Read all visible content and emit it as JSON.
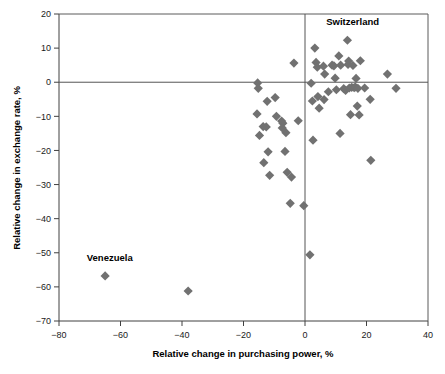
{
  "chart_data": {
    "type": "scatter",
    "title": "",
    "xlabel": "Relative change in purchasing power, %",
    "ylabel": "Relative change in exchange rate, %",
    "xlim": [
      -80,
      40
    ],
    "ylim": [
      -70,
      20
    ],
    "xticks": [
      -80,
      -60,
      -40,
      -20,
      0,
      20,
      40
    ],
    "xtick_labels": [
      "−80",
      "−60",
      "−40",
      "−20",
      "0",
      "20",
      "40"
    ],
    "yticks": [
      20,
      10,
      0,
      -10,
      -20,
      -30,
      -40,
      -50,
      -60,
      -70
    ],
    "ytick_labels": [
      "20",
      "10",
      "0",
      "−10",
      "−20",
      "−30",
      "−40",
      "−50",
      "−60",
      "−70"
    ],
    "grid": false,
    "legend": null,
    "reference_lines": {
      "x_zero": 0,
      "y_zero": 0
    },
    "marker": {
      "shape": "diamond",
      "color": "#717171",
      "size": 4.6
    },
    "annotations": [
      {
        "text": "Switzerland",
        "x": 15.5,
        "y": 16.8
      },
      {
        "text": "Venezuela",
        "x": -63.5,
        "y": -52.5
      }
    ],
    "points": [
      {
        "x": -65.0,
        "y": -56.8
      },
      {
        "x": -38.0,
        "y": -61.2
      },
      {
        "x": -15.4,
        "y": -0.2
      },
      {
        "x": -15.2,
        "y": -1.8
      },
      {
        "x": -15.6,
        "y": -9.3
      },
      {
        "x": -14.8,
        "y": -15.6
      },
      {
        "x": -13.6,
        "y": -13.0
      },
      {
        "x": -12.3,
        "y": -5.6
      },
      {
        "x": -12.6,
        "y": -13.1
      },
      {
        "x": -13.4,
        "y": -23.6
      },
      {
        "x": -12.0,
        "y": -20.4
      },
      {
        "x": -11.5,
        "y": -27.3
      },
      {
        "x": -9.7,
        "y": -4.5
      },
      {
        "x": -9.3,
        "y": -10.0
      },
      {
        "x": -7.6,
        "y": -11.4
      },
      {
        "x": -7.2,
        "y": -12.0
      },
      {
        "x": -7.4,
        "y": -13.4
      },
      {
        "x": -6.2,
        "y": -14.8
      },
      {
        "x": -6.5,
        "y": -20.3
      },
      {
        "x": -5.8,
        "y": -26.4
      },
      {
        "x": -4.4,
        "y": -27.8
      },
      {
        "x": -4.8,
        "y": -35.5
      },
      {
        "x": -3.6,
        "y": 5.6
      },
      {
        "x": -2.2,
        "y": -11.3
      },
      {
        "x": -0.4,
        "y": -36.2
      },
      {
        "x": 1.6,
        "y": -50.6
      },
      {
        "x": 2.0,
        "y": -0.3
      },
      {
        "x": 2.4,
        "y": -5.5
      },
      {
        "x": 2.6,
        "y": -17.0
      },
      {
        "x": 3.2,
        "y": 10.0
      },
      {
        "x": 3.6,
        "y": 5.8
      },
      {
        "x": 4.0,
        "y": 4.4
      },
      {
        "x": 4.2,
        "y": -4.2
      },
      {
        "x": 4.6,
        "y": -7.6
      },
      {
        "x": 6.0,
        "y": 4.7
      },
      {
        "x": 6.4,
        "y": 2.4
      },
      {
        "x": 6.2,
        "y": -5.1
      },
      {
        "x": 7.6,
        "y": -2.8
      },
      {
        "x": 8.8,
        "y": 5.0
      },
      {
        "x": 9.4,
        "y": 4.8
      },
      {
        "x": 9.8,
        "y": 1.2
      },
      {
        "x": 10.2,
        "y": -2.2
      },
      {
        "x": 11.0,
        "y": 7.7
      },
      {
        "x": 11.6,
        "y": 5.0
      },
      {
        "x": 11.4,
        "y": -15.0
      },
      {
        "x": 12.6,
        "y": -1.9
      },
      {
        "x": 13.2,
        "y": -2.4
      },
      {
        "x": 13.8,
        "y": 12.3
      },
      {
        "x": 14.2,
        "y": 6.2
      },
      {
        "x": 14.0,
        "y": 5.2
      },
      {
        "x": 14.4,
        "y": -1.7
      },
      {
        "x": 14.8,
        "y": -9.5
      },
      {
        "x": 15.6,
        "y": 4.9
      },
      {
        "x": 15.2,
        "y": -1.5
      },
      {
        "x": 16.0,
        "y": -1.6
      },
      {
        "x": 16.6,
        "y": 1.1
      },
      {
        "x": 16.4,
        "y": -1.4
      },
      {
        "x": 17.2,
        "y": -1.8
      },
      {
        "x": 17.0,
        "y": -7.0
      },
      {
        "x": 17.6,
        "y": -9.6
      },
      {
        "x": 18.0,
        "y": 6.3
      },
      {
        "x": 19.4,
        "y": -1.7
      },
      {
        "x": 21.2,
        "y": -5.0
      },
      {
        "x": 21.4,
        "y": -22.9
      },
      {
        "x": 26.8,
        "y": 2.4
      },
      {
        "x": 29.6,
        "y": -1.8
      }
    ]
  }
}
